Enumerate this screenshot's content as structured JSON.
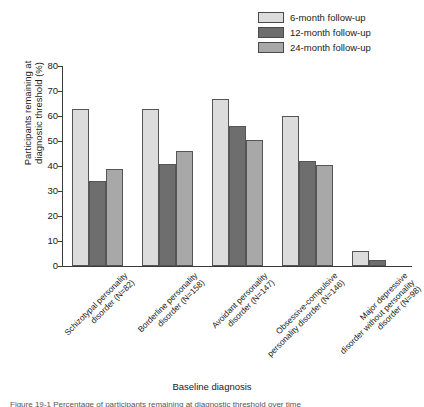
{
  "chart_data": {
    "type": "bar",
    "title": "",
    "xlabel": "Baseline diagnosis",
    "ylabel": "Participants remaining at diagnostic threshold (%)",
    "ylabel_line1": "Participants remaining at",
    "ylabel_line2": "diagnostic threshold (%)",
    "ylim": [
      0,
      80
    ],
    "yticks": [
      0,
      10,
      20,
      30,
      40,
      50,
      60,
      70,
      80
    ],
    "ytick_labels": [
      "0",
      "10",
      "20",
      "30",
      "40",
      "50",
      "60",
      "70",
      "80"
    ],
    "grid": false,
    "legend_position": "top-right",
    "categories": [
      "Schizotypal personality disorder (N=82)",
      "Borderline personality disorder (N=158)",
      "Avoidant personality disorder (N=147)",
      "Obsessive-compulsive personality disorder (N=146)",
      "Major depressive disorder without personality disorder (N=98)"
    ],
    "category_lines": [
      [
        "Schizotypal personality",
        "disorder (N=82)"
      ],
      [
        "Borderline personality",
        "disorder (N=158)"
      ],
      [
        "Avoidant personality",
        "disorder (N=147)"
      ],
      [
        "Obsessive-compulsive",
        "personality disorder (N=146)"
      ],
      [
        "Major depressive",
        "disorder without personality",
        "disorder (N=98)"
      ]
    ],
    "series": [
      {
        "name": "6-month follow-up",
        "color": "#dcdcdc",
        "values": [
          63,
          63,
          67,
          60,
          6
        ]
      },
      {
        "name": "12-month follow-up",
        "color": "#6e6e6e",
        "values": [
          34,
          41,
          56,
          42,
          2.5
        ]
      },
      {
        "name": "24-month follow-up",
        "color": "#a8a8a8",
        "values": [
          39,
          46,
          50.5,
          40.5,
          0
        ]
      }
    ]
  },
  "legend": {
    "items": [
      {
        "label": "6-month follow-up",
        "color": "#dcdcdc"
      },
      {
        "label": "12-month follow-up",
        "color": "#6e6e6e"
      },
      {
        "label": "24-month follow-up",
        "color": "#a8a8a8"
      }
    ]
  },
  "caption": {
    "text": "Figure 19-1 Percentage of participants remaining at diagnostic threshold over time"
  }
}
